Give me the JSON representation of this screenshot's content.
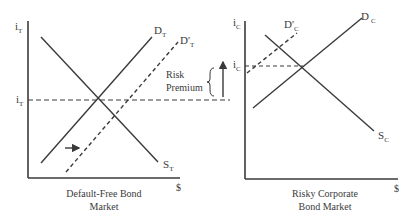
{
  "colors": {
    "line": "#3a3a3a",
    "background": "#ffffff"
  },
  "left_panel": {
    "caption_line1": "Default-Free Bond",
    "caption_line2": "Market",
    "y_axis_label": "i",
    "y_axis_sub": "T",
    "x_axis_label": "$",
    "equilibrium_rate_label": "i",
    "equilibrium_rate_sub": "T",
    "demand_label": "D",
    "demand_sub": "T",
    "new_demand_label": "D'",
    "new_demand_sub": "T",
    "supply_label": "S",
    "supply_sub": "T",
    "risk_premium_line1": "Risk",
    "risk_premium_line2": "Premium"
  },
  "right_panel": {
    "caption_line1": "Risky Corporate",
    "caption_line2": "Bond Market",
    "y_axis_label": "i",
    "y_axis_sub": "C",
    "x_axis_label": "$",
    "equilibrium_rate_label": "i",
    "equilibrium_rate_sub": "C",
    "demand_label": "D",
    "demand_sub": "C",
    "new_demand_label": "D'",
    "new_demand_sub": "C",
    "supply_label": "S",
    "supply_sub": "C"
  }
}
